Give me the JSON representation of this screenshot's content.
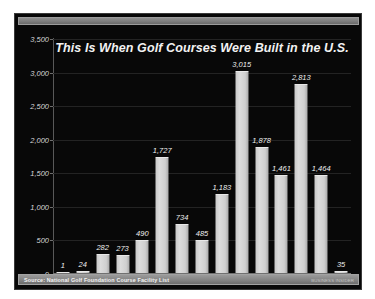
{
  "chart_data": {
    "type": "bar",
    "title": "This Is When Golf Courses Were Built in the U.S.",
    "xlabel": "",
    "ylabel": "",
    "categories": [
      "1870",
      "1880",
      "1890",
      "1900",
      "1910",
      "1920",
      "1930",
      "1940",
      "1950",
      "1960",
      "1970",
      "1980",
      "1990",
      "2000",
      "2010"
    ],
    "values": [
      1,
      24,
      282,
      273,
      490,
      1727,
      734,
      485,
      1183,
      3015,
      1878,
      1461,
      2813,
      1464,
      35
    ],
    "value_labels": [
      "1",
      "24",
      "282",
      "273",
      "490",
      "1,727",
      "734",
      "485",
      "1,183",
      "3,015",
      "1,878",
      "1,461",
      "2,813",
      "1,464",
      "35"
    ],
    "ylim": [
      0,
      3500
    ],
    "ytick_values": [
      0,
      500,
      1000,
      1500,
      2000,
      2500,
      3000,
      3500
    ],
    "ytick_labels": [
      "0",
      "500",
      "1,000",
      "1,500",
      "2,000",
      "2,500",
      "3,000",
      "3,500"
    ],
    "grid": true,
    "legend": false,
    "bar_color": "#d4d4d4",
    "background_color": "#080808",
    "text_color": "#f0f0f0"
  },
  "footer": {
    "source": "Source:  National Golf Foundation Course Facility List",
    "credit": "BUSINESS INSIDER"
  }
}
